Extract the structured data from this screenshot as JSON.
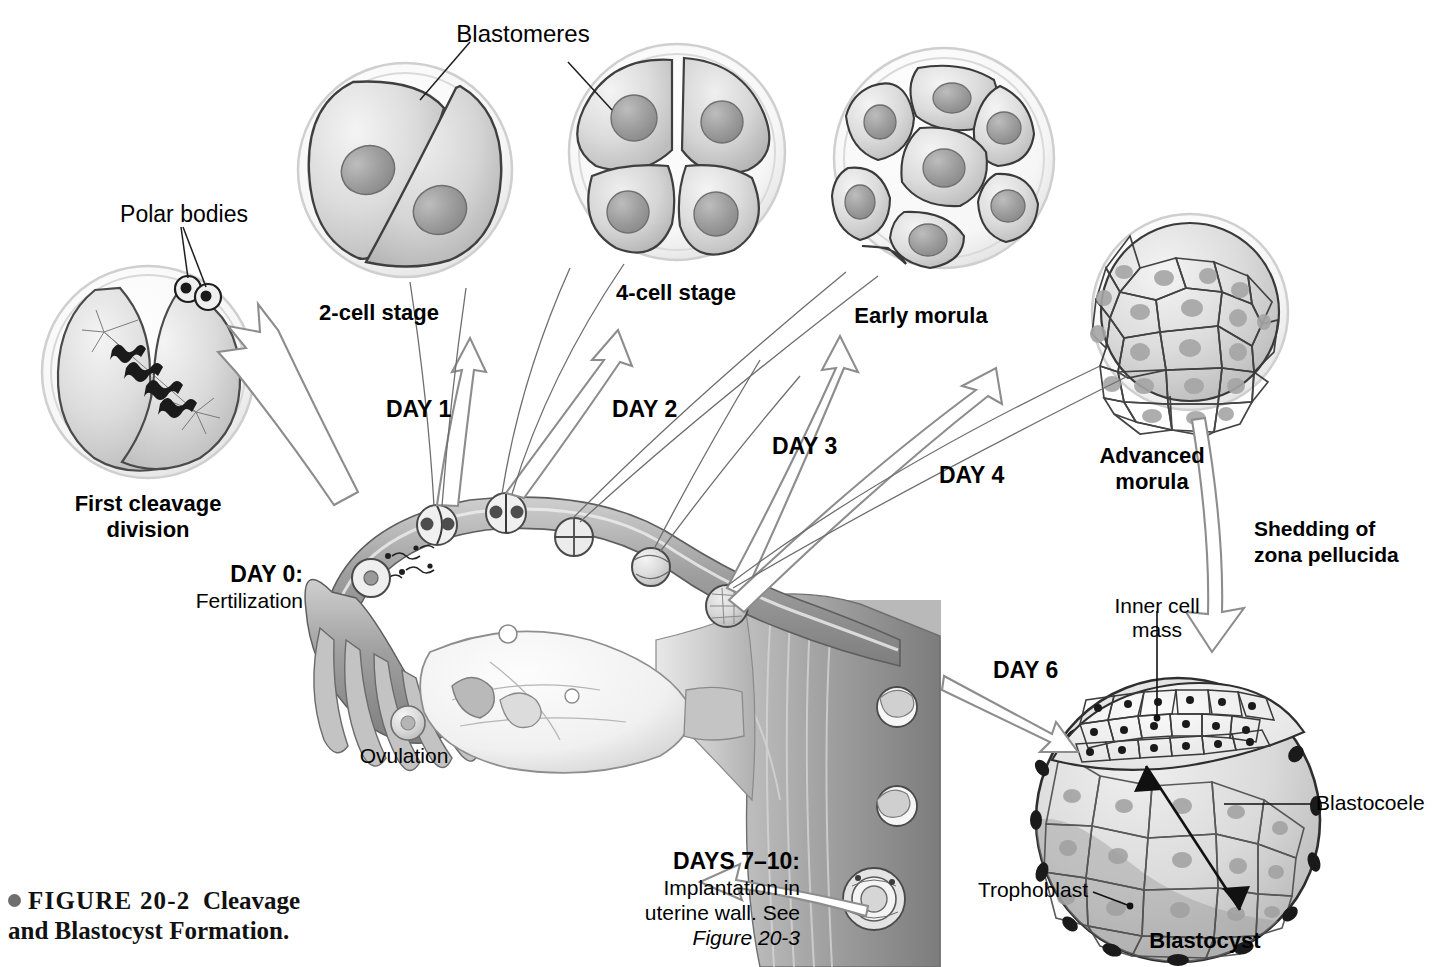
{
  "figure": {
    "bullet_icon": "filled-circle",
    "number": "FIGURE 20-2",
    "title_line1": "Cleavage",
    "title_line2": "and Blastocyst Formation."
  },
  "labels": {
    "blastomeres": "Blastomeres",
    "polar_bodies": "Polar bodies",
    "two_cell": "2-cell stage",
    "four_cell": "4-cell stage",
    "early_morula": "Early morula",
    "advanced_morula_l1": "Advanced",
    "advanced_morula_l2": "morula",
    "first_cleavage_l1": "First cleavage",
    "first_cleavage_l2": "division",
    "shedding_l1": "Shedding of",
    "shedding_l2": "zona pellucida",
    "inner_cell_mass_l1": "Inner cell",
    "inner_cell_mass_l2": "mass",
    "blastocoele": "Blastocoele",
    "trophoblast": "Trophoblast",
    "blastocyst": "Blastocyst",
    "ovulation": "Ovulation",
    "fertilization": "Fertilization"
  },
  "days": {
    "day0": "DAY 0:",
    "day1": "DAY 1",
    "day2": "DAY 2",
    "day3": "DAY 3",
    "day4": "DAY 4",
    "day6": "DAY 6",
    "days7to10": "DAYS 7–10:",
    "implantation_l1": "Implantation in",
    "implantation_l2": "uterine wall.",
    "implantation_see": "See",
    "implantation_ref": "Figure 20-3"
  },
  "colors": {
    "ink": "#000000",
    "cell_fill": "#d8d8d8",
    "cell_fill_light": "#eaeaea",
    "nucleus": "#9a9a9a",
    "zona": "#f2f2f2",
    "zona_edge": "#c9c9c9",
    "outline": "#3c3c3c",
    "tissue_dark": "#8e8e8e",
    "tissue_mid": "#b4b4b4",
    "tissue_light": "#dcdcdc",
    "arrow_stroke": "#8a8a8a",
    "leader": "#5a5a5a",
    "panel_bg": "#ffffff"
  },
  "structures": {
    "stage_cells": [
      {
        "name": "first-cleavage-division",
        "cells": 2,
        "note": "anaphase spindles and chromosomes"
      },
      {
        "name": "two-cell-stage",
        "cells": 2
      },
      {
        "name": "four-cell-stage",
        "cells": 4
      },
      {
        "name": "early-morula",
        "cells": 9
      },
      {
        "name": "advanced-morula",
        "cells": 28
      },
      {
        "name": "blastocyst",
        "cells": 30,
        "note": "inner cell mass, trophoblast, blastocoele"
      }
    ],
    "tube_embryos": [
      "zygote",
      "2-cell",
      "4-cell",
      "early-morula",
      "advanced-morula",
      "morula"
    ],
    "uterus_embryos": [
      "free-blastocyst",
      "attaching-blastocyst",
      "implanting-blastocyst"
    ]
  }
}
